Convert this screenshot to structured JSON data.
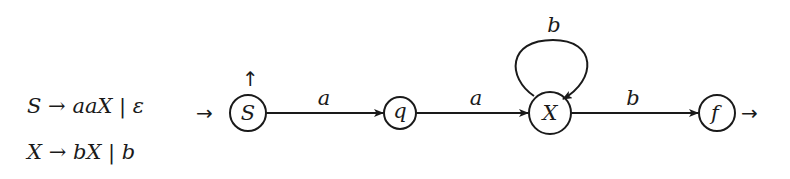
{
  "grammar": {
    "rules": [
      {
        "lhs": "S",
        "arrow": "→",
        "rhs": "aaX",
        "sep": "|",
        "alt": "ε"
      },
      {
        "lhs": "X",
        "arrow": "→",
        "rhs": "bX",
        "sep": "|",
        "alt": "b"
      }
    ]
  },
  "automaton": {
    "states": [
      {
        "id": "S",
        "label": "S",
        "initial": true,
        "final": true
      },
      {
        "id": "q",
        "label": "q",
        "initial": false,
        "final": false
      },
      {
        "id": "X",
        "label": "X",
        "initial": false,
        "final": false
      },
      {
        "id": "f",
        "label": "f",
        "initial": false,
        "final": true
      }
    ],
    "transitions": [
      {
        "from": "S",
        "to": "q",
        "label": "a"
      },
      {
        "from": "q",
        "to": "X",
        "label": "a"
      },
      {
        "from": "X",
        "to": "X",
        "label": "b"
      },
      {
        "from": "X",
        "to": "f",
        "label": "b"
      }
    ],
    "initial_marker": "→",
    "final_marker_S": "↑",
    "final_marker_f": "→"
  },
  "colors": {
    "stroke": "#1a1a1a",
    "background": "#ffffff"
  }
}
